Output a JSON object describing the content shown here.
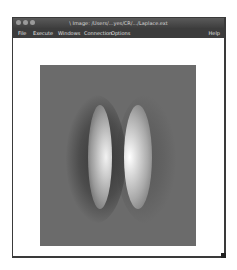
{
  "window": {
    "title": "\\ Image: /Users/...yes/CR/.../Laplace.ext",
    "traffic_lights": [
      "close",
      "minimize",
      "zoom"
    ]
  },
  "menubar": {
    "items": [
      {
        "label": "File"
      },
      {
        "label": "Execute"
      },
      {
        "label": "Windows"
      },
      {
        "label": "Connection"
      },
      {
        "label": "Options"
      }
    ],
    "help_label": "Help"
  },
  "image_view": {
    "description": "grayscale Laplace field: two vertical bright elongated blobs with dark halos on gray background",
    "background_color": "#6b6b6b"
  }
}
